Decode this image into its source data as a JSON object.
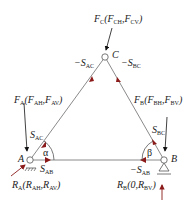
{
  "diagram": {
    "type": "truss-free-body",
    "nodes": {
      "A": {
        "label": "A",
        "x": 30,
        "y": 160
      },
      "B": {
        "label": "B",
        "x": 164,
        "y": 160
      },
      "C": {
        "label": "C",
        "x": 105,
        "y": 57
      }
    },
    "members": [
      {
        "from": "A",
        "to": "C"
      },
      {
        "from": "B",
        "to": "C"
      },
      {
        "from": "A",
        "to": "B"
      }
    ],
    "labels": {
      "node_a": "A",
      "node_b": "B",
      "node_c": "C",
      "fc": {
        "main": "F",
        "sub": "C",
        "open": "(F",
        "s1": "CH",
        "mid": ",F",
        "s2": "CV",
        "close": ")"
      },
      "fa": {
        "main": "F",
        "sub": "A",
        "open": "(F",
        "s1": "AH",
        "mid": ",F",
        "s2": "AV",
        "close": ")"
      },
      "fb": {
        "main": "F",
        "sub": "B",
        "open": "(F",
        "s1": "BH",
        "mid": ",F",
        "s2": "BV",
        "close": ")"
      },
      "ra": {
        "main": "R",
        "sub": "A",
        "open": "(R",
        "s1": "AH",
        "mid": ",R",
        "s2": "AV",
        "close": ")"
      },
      "rb": {
        "main": "R",
        "sub": "B",
        "open": "(0,R",
        "s1": "BV",
        "close": ")"
      },
      "s_ac_top": {
        "prefix": "−S",
        "sub": "AC"
      },
      "s_bc_top": {
        "prefix": "−S",
        "sub": "BC"
      },
      "s_ac": {
        "prefix": "S",
        "sub": "AC"
      },
      "s_bc": {
        "prefix": "S",
        "sub": "BC"
      },
      "s_ab": {
        "prefix": "S",
        "sub": "AB"
      },
      "s_ab_neg": {
        "prefix": "−S",
        "sub": "AB"
      },
      "alpha": "α",
      "beta": "β"
    },
    "colors": {
      "member": "#8a8a8a",
      "arrow_member": "#8b1a1a",
      "arrow_load": "#111111",
      "reaction": "#8b1a1a",
      "text": "#222222"
    }
  }
}
